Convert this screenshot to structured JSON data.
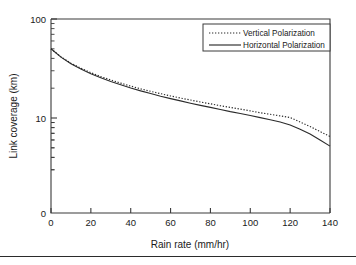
{
  "chart_data": {
    "type": "line",
    "title": "",
    "xlabel": "Rain rate (mm/hr)",
    "ylabel": "Link coverage (km)",
    "xlim": [
      0,
      140
    ],
    "ylim": [
      2.7,
      100
    ],
    "yscale": "log",
    "xticks": [
      0,
      20,
      40,
      60,
      80,
      100,
      120,
      140
    ],
    "xtick_labels": [
      "0",
      "20",
      "40",
      "60",
      "80",
      "100",
      "120",
      "140"
    ],
    "ytick_labels": [
      "100",
      "10",
      "0"
    ],
    "yticks": [
      100,
      10,
      2.7
    ],
    "grid": false,
    "legend_position": "upper right",
    "x": [
      0,
      5,
      10,
      15,
      20,
      25,
      30,
      35,
      40,
      45,
      50,
      55,
      60,
      65,
      70,
      75,
      80,
      85,
      90,
      95,
      100,
      105,
      110,
      115,
      120,
      125,
      130,
      135,
      140
    ],
    "series": [
      {
        "name": "Vertical Polarization",
        "style": "dotted",
        "color": "#2b2b2b",
        "values": [
          50.0,
          41.5,
          35.8,
          31.8,
          28.7,
          26.2,
          24.2,
          22.5,
          21.0,
          19.7,
          18.6,
          17.6,
          16.7,
          15.9,
          15.2,
          14.5,
          13.9,
          13.3,
          12.8,
          12.3,
          11.8,
          11.3,
          10.9,
          10.5,
          10.1,
          9.1,
          8.2,
          7.3,
          6.5
        ]
      },
      {
        "name": "Horizontal Polarization",
        "style": "solid",
        "color": "#2b2b2b",
        "values": [
          50.0,
          41.2,
          35.3,
          31.2,
          28.0,
          25.5,
          23.4,
          21.7,
          20.1,
          18.8,
          17.7,
          16.6,
          15.7,
          14.9,
          14.1,
          13.4,
          12.8,
          12.2,
          11.6,
          11.1,
          10.6,
          10.1,
          9.6,
          9.1,
          8.5,
          7.7,
          6.9,
          6.0,
          5.2
        ]
      }
    ],
    "legend": [
      {
        "label": "Vertical Polarization",
        "style": "dotted"
      },
      {
        "label": "Horizontal Polarization",
        "style": "solid"
      }
    ]
  }
}
